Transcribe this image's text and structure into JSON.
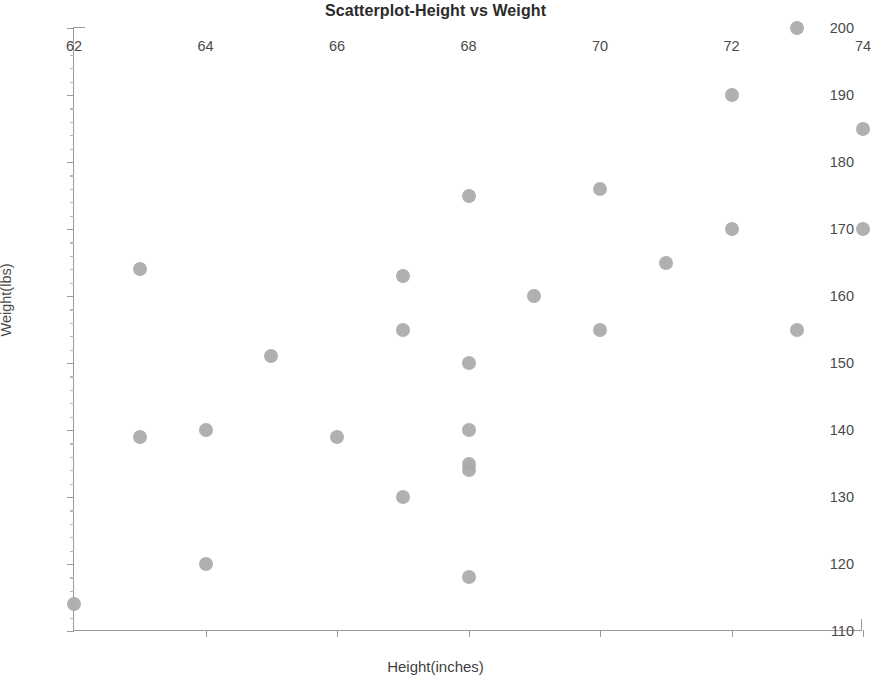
{
  "chart_data": {
    "type": "scatter",
    "title": "Scatterplot-Height vs Weight",
    "xlabel": "Height(inches)",
    "ylabel": "Weight(lbs)",
    "xlim": [
      62,
      74
    ],
    "ylim": [
      110,
      200
    ],
    "xticks": [
      62,
      64,
      66,
      68,
      70,
      72,
      74
    ],
    "yticks": [
      110,
      120,
      130,
      140,
      150,
      160,
      170,
      180,
      190,
      200
    ],
    "xtick_labels": [
      "62",
      "64",
      "66",
      "68",
      "70",
      "72",
      "74"
    ],
    "ytick_labels": [
      "110",
      "120",
      "130",
      "140",
      "150",
      "160",
      "170",
      "180",
      "190",
      "200"
    ],
    "grid": false,
    "legend": null,
    "marker_color": "#a9a9a9",
    "marker_size_px": 14,
    "points": [
      {
        "x": 62,
        "y": 114
      },
      {
        "x": 63,
        "y": 164
      },
      {
        "x": 63,
        "y": 139
      },
      {
        "x": 64,
        "y": 140
      },
      {
        "x": 64,
        "y": 120
      },
      {
        "x": 65,
        "y": 151
      },
      {
        "x": 66,
        "y": 139
      },
      {
        "x": 67,
        "y": 163
      },
      {
        "x": 67,
        "y": 155
      },
      {
        "x": 67,
        "y": 130
      },
      {
        "x": 68,
        "y": 175
      },
      {
        "x": 68,
        "y": 150
      },
      {
        "x": 68,
        "y": 140
      },
      {
        "x": 68,
        "y": 135
      },
      {
        "x": 68,
        "y": 134
      },
      {
        "x": 68,
        "y": 118
      },
      {
        "x": 69,
        "y": 160
      },
      {
        "x": 70,
        "y": 176
      },
      {
        "x": 70,
        "y": 155
      },
      {
        "x": 71,
        "y": 165
      },
      {
        "x": 72,
        "y": 190
      },
      {
        "x": 72,
        "y": 170
      },
      {
        "x": 73,
        "y": 200
      },
      {
        "x": 73,
        "y": 155
      },
      {
        "x": 74,
        "y": 185
      },
      {
        "x": 74,
        "y": 170
      }
    ]
  }
}
